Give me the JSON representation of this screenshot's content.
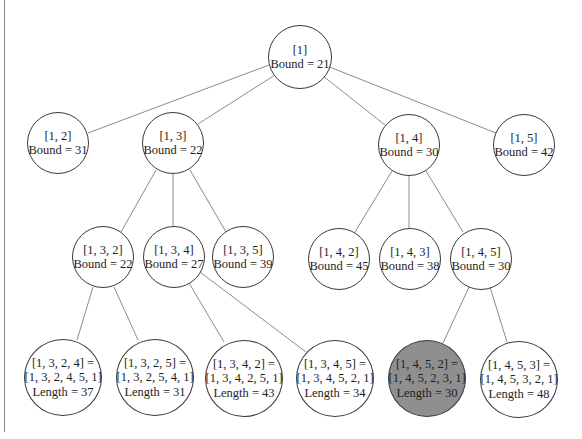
{
  "diagram": {
    "type": "branch-and-bound state space tree",
    "colors": {
      "edge": "#8c8c8c",
      "node_border": "#3a3a3a",
      "node_fill": "#ffffff",
      "highlight_fill": "#8f8f8f",
      "text": "#1e1e1e"
    },
    "nodes": {
      "root": {
        "path": "[1]",
        "value": "Bound = 21"
      },
      "n12": {
        "path": "[1, 2]",
        "value": "Bound = 31"
      },
      "n13": {
        "path": "[1, 3]",
        "value": "Bound = 22"
      },
      "n14": {
        "path": "[1, 4]",
        "value": "Bound = 30"
      },
      "n15": {
        "path": "[1, 5]",
        "value": "Bound = 42"
      },
      "n132": {
        "path": "[1, 3, 2]",
        "value": "Bound = 22"
      },
      "n134": {
        "path": "[1, 3, 4]",
        "value": "Bound = 27"
      },
      "n135": {
        "path": "[1, 3, 5]",
        "value": "Bound = 39"
      },
      "n142": {
        "path": "[1, 4, 2]",
        "value": "Bound = 45"
      },
      "n143": {
        "path": "[1, 4, 3]",
        "value": "Bound = 38"
      },
      "n145": {
        "path": "[1, 4, 5]",
        "value": "Bound = 30"
      },
      "n1324": {
        "path": "[1, 3, 2, 4] =",
        "tour": "[1, 3, 2, 4, 5, 1]",
        "value": "Length = 37"
      },
      "n1325": {
        "path": "[1, 3, 2, 5] =",
        "tour": "[1, 3, 2, 5, 4, 1]",
        "value": "Length = 31"
      },
      "n1342": {
        "path": "[1, 3, 4, 2] =",
        "tour": "[1, 3, 4, 2, 5, 1]",
        "value": "Length = 43"
      },
      "n1345": {
        "path": "[1, 3, 4, 5] =",
        "tour": "[1, 3, 4, 5, 2, 1]",
        "value": "Length = 34"
      },
      "n1452": {
        "path": "[1, 4, 5, 2] =",
        "tour": "[1, 4, 5, 2, 3, 1]",
        "value": "Length = 30",
        "highlighted": true
      },
      "n1453": {
        "path": "[1, 4, 5, 3] =",
        "tour": "[1, 4, 5, 3, 2, 1]",
        "value": "Length = 48"
      }
    },
    "edges": [
      [
        "root",
        "n12"
      ],
      [
        "root",
        "n13"
      ],
      [
        "root",
        "n14"
      ],
      [
        "root",
        "n15"
      ],
      [
        "n13",
        "n132"
      ],
      [
        "n13",
        "n134"
      ],
      [
        "n13",
        "n135"
      ],
      [
        "n14",
        "n142"
      ],
      [
        "n14",
        "n143"
      ],
      [
        "n14",
        "n145"
      ],
      [
        "n132",
        "n1324"
      ],
      [
        "n132",
        "n1325"
      ],
      [
        "n134",
        "n1342"
      ],
      [
        "n134",
        "n1345"
      ],
      [
        "n145",
        "n1452"
      ],
      [
        "n145",
        "n1453"
      ]
    ]
  }
}
